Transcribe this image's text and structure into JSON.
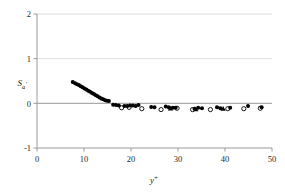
{
  "chart_data": {
    "type": "scatter",
    "title": "",
    "xlabel": "y+",
    "xlabel_base": "y",
    "xlabel_sup": "+",
    "ylabel": "Sa'",
    "ylabel_base": "S",
    "ylabel_sub": "a",
    "ylabel_prime": "'",
    "xlim": [
      0,
      50
    ],
    "ylim": [
      -1,
      2
    ],
    "xticks": [
      0,
      10,
      20,
      30,
      40,
      50
    ],
    "xtick_labels": [
      "0",
      "10",
      "20",
      "30",
      "40",
      "50"
    ],
    "yticks": [
      -1,
      0,
      1,
      2
    ],
    "ytick_labels": [
      "-1",
      "0",
      "1",
      "2"
    ],
    "grid": "horizontal-faint",
    "legend": "none",
    "zero_line": true,
    "series": [
      {
        "name": "filled-marker-series",
        "marker": "filled-diamond",
        "color": "#000000",
        "points": [
          [
            7.6,
            0.48
          ],
          [
            8.1,
            0.45
          ],
          [
            8.5,
            0.43
          ],
          [
            8.9,
            0.41
          ],
          [
            9.3,
            0.38
          ],
          [
            9.7,
            0.36
          ],
          [
            10.1,
            0.33
          ],
          [
            10.5,
            0.31
          ],
          [
            10.9,
            0.28
          ],
          [
            11.3,
            0.26
          ],
          [
            11.7,
            0.23
          ],
          [
            12.1,
            0.21
          ],
          [
            12.5,
            0.18
          ],
          [
            12.9,
            0.16
          ],
          [
            13.3,
            0.13
          ],
          [
            13.7,
            0.11
          ],
          [
            14.1,
            0.09
          ],
          [
            14.5,
            0.07
          ],
          [
            14.9,
            0.06
          ],
          [
            15.3,
            0.05
          ],
          [
            16.2,
            -0.03
          ],
          [
            16.8,
            -0.04
          ],
          [
            17.4,
            -0.05
          ],
          [
            18.6,
            -0.06
          ],
          [
            19.2,
            -0.06
          ],
          [
            19.8,
            -0.05
          ],
          [
            20.4,
            -0.05
          ],
          [
            21.0,
            -0.06
          ],
          [
            21.6,
            -0.04
          ],
          [
            24.3,
            -0.08
          ],
          [
            25.0,
            -0.09
          ],
          [
            27.4,
            -0.07
          ],
          [
            28.0,
            -0.09
          ],
          [
            28.9,
            -0.1
          ],
          [
            29.5,
            -0.1
          ],
          [
            33.5,
            -0.12
          ],
          [
            34.3,
            -0.1
          ],
          [
            35.1,
            -0.11
          ],
          [
            38.3,
            -0.09
          ],
          [
            39.0,
            -0.11
          ],
          [
            41.1,
            -0.1
          ],
          [
            44.9,
            -0.06
          ],
          [
            47.8,
            -0.09
          ]
        ]
      },
      {
        "name": "open-circle-series",
        "marker": "open-circle",
        "color": "#000000",
        "points": [
          [
            18.0,
            -0.1
          ],
          [
            19.6,
            -0.09
          ],
          [
            22.3,
            -0.12
          ],
          [
            26.4,
            -0.14
          ],
          [
            29.8,
            -0.11
          ],
          [
            33.1,
            -0.14
          ],
          [
            36.9,
            -0.14
          ],
          [
            40.6,
            -0.12
          ],
          [
            44.0,
            -0.12
          ],
          [
            47.5,
            -0.11
          ]
        ]
      },
      {
        "name": "filled-triangle-series",
        "marker": "filled-triangle",
        "color": "#000000",
        "points": [
          [
            28.4,
            -0.11
          ],
          [
            33.8,
            -0.13
          ],
          [
            39.6,
            -0.12
          ]
        ]
      }
    ]
  },
  "colors": {
    "axis": "#808080",
    "gridline": "#d9d9d9",
    "zero_line": "#8c8c8c",
    "marker": "#000000",
    "text": "#2b2b2b",
    "background": "#ffffff"
  }
}
